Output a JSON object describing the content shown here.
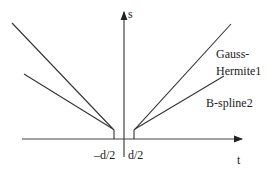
{
  "diagram": {
    "axes": {
      "x_label": "t",
      "y_label": "s"
    },
    "ticks": {
      "left": "–d/2",
      "right": "d/2"
    },
    "curves": [
      {
        "name": "Gauss-Hermite1",
        "label_line1": "Gauss-",
        "label_line2": "Hermite1"
      },
      {
        "name": "B-spline2",
        "label": "B-spline2"
      }
    ],
    "colors": {
      "line": "#333333",
      "text": "#222222",
      "background": "#ffffff"
    }
  }
}
